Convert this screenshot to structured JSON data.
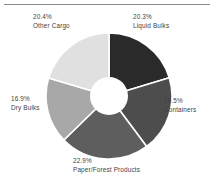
{
  "chart_data": {
    "type": "pie",
    "variant": "donut",
    "title": "",
    "xlabel": "",
    "ylabel": "",
    "units": "percent",
    "start_angle_deg": 0,
    "direction": "clockwise",
    "inner_radius_ratio": 0.3,
    "total": "100.0%",
    "legend": "none",
    "labels_position": "outside-callout",
    "categories": [
      "Liquid Bulks",
      "Containers",
      "Paper/Forest Products",
      "Dry Bulks",
      "Other Cargo"
    ],
    "values": [
      20.3,
      19.5,
      22.9,
      16.9,
      20.4
    ],
    "slices": [
      {
        "name": "Liquid Bulks",
        "value": 20.3,
        "percent_label": "20.3%",
        "color": "#2a2a2a",
        "order": 1
      },
      {
        "name": "Containers",
        "value": 19.5,
        "percent_label": "19.5%",
        "color": "#4d4d4d",
        "order": 2
      },
      {
        "name": "Paper/Forest Products",
        "value": 22.9,
        "percent_label": "22.9%",
        "color": "#5e5e5e",
        "order": 3
      },
      {
        "name": "Dry Bulks",
        "value": 16.9,
        "percent_label": "16.9%",
        "color": "#a8a8a8",
        "order": 4
      },
      {
        "name": "Other Cargo",
        "value": 20.4,
        "percent_label": "20.4%",
        "color": "#e0e0e0",
        "order": 5
      }
    ],
    "separator_color": "#ffffff",
    "hole_color": "#ffffff",
    "background_color": "#ffffff",
    "rule_color": "#8a8a8a"
  }
}
